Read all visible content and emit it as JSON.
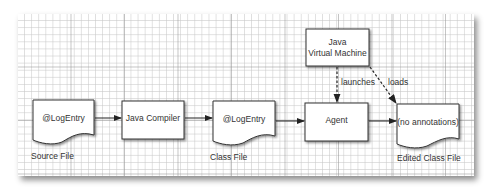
{
  "diagram": {
    "nodes": [
      {
        "id": "source-file",
        "type": "document",
        "text": "@LogEntry",
        "caption": "Source File"
      },
      {
        "id": "java-compiler",
        "type": "process",
        "text": "Java Compiler"
      },
      {
        "id": "class-file",
        "type": "document",
        "text": "@LogEntry",
        "caption": "Class File"
      },
      {
        "id": "agent",
        "type": "process",
        "text": "Agent"
      },
      {
        "id": "jvm",
        "type": "process",
        "text_line1": "Java",
        "text_line2": "Virtual Machine"
      },
      {
        "id": "edited-class-file",
        "type": "document",
        "text": "(no annotations)",
        "caption": "Edited Class File"
      }
    ],
    "edges": [
      {
        "from": "source-file",
        "to": "java-compiler",
        "style": "solid"
      },
      {
        "from": "java-compiler",
        "to": "class-file",
        "style": "solid"
      },
      {
        "from": "class-file",
        "to": "agent",
        "style": "solid"
      },
      {
        "from": "agent",
        "to": "edited-class-file",
        "style": "solid"
      },
      {
        "from": "jvm",
        "to": "agent",
        "style": "dashed",
        "label": "launches"
      },
      {
        "from": "jvm",
        "to": "edited-class-file",
        "style": "dashed",
        "label": "loads"
      }
    ]
  },
  "colors": {
    "stroke": "#333333",
    "fill": "#ffffff",
    "grid": "#c8c8c8",
    "text": "#333333"
  }
}
